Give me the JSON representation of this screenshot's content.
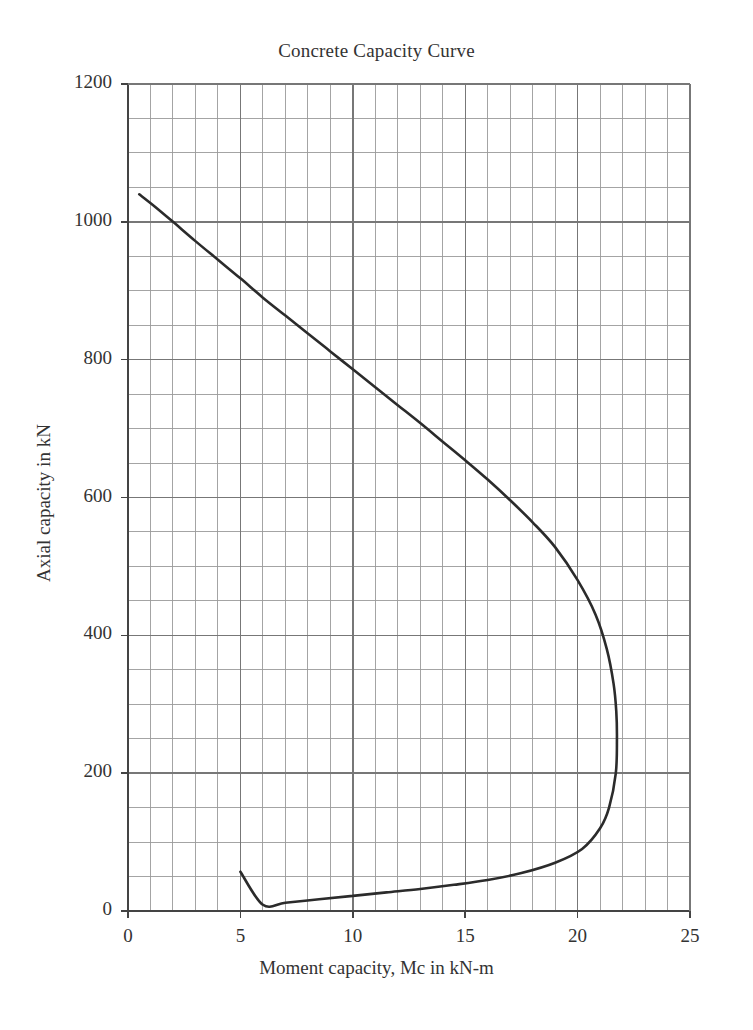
{
  "chart_data": {
    "type": "line",
    "title": "Concrete Capacity Curve",
    "xlabel": "Moment capacity, Mc in kN-m",
    "ylabel": "Axial capacity in kN",
    "xlim": [
      0,
      25
    ],
    "ylim": [
      0,
      1200
    ],
    "x_major_ticks": [
      0,
      5,
      10,
      15,
      20,
      25
    ],
    "y_major_ticks": [
      0,
      200,
      400,
      600,
      800,
      1000,
      1200
    ],
    "x_minor_step": 1,
    "y_minor_step": 50,
    "x_tick_labels": [
      "0",
      "5",
      "10",
      "15",
      "20",
      "25"
    ],
    "y_tick_labels": [
      "0",
      "200",
      "400",
      "600",
      "800",
      "1000",
      "1200"
    ],
    "grid": true,
    "legend": false,
    "legend_position": "none",
    "line_color": "#2b2b2b",
    "grid_color": "#777777",
    "axis_color": "#444444",
    "background_color": "#ffffff",
    "annotations": [],
    "series": [
      {
        "name": "Concrete capacity interaction curve",
        "comment": "P-M interaction diagram: x = moment capacity Mc (kN-m), y = axial capacity (kN)",
        "points": [
          [
            0.5,
            1040
          ],
          [
            1.2,
            1022
          ],
          [
            2.0,
            1000
          ],
          [
            3.0,
            972
          ],
          [
            4.0,
            945
          ],
          [
            5.0,
            918
          ],
          [
            6.0,
            890
          ],
          [
            7.0,
            864
          ],
          [
            8.0,
            838
          ],
          [
            9.0,
            812
          ],
          [
            10.0,
            786
          ],
          [
            11.0,
            760
          ],
          [
            12.0,
            734
          ],
          [
            13.0,
            708
          ],
          [
            14.0,
            681
          ],
          [
            15.0,
            654
          ],
          [
            16.0,
            626
          ],
          [
            17.0,
            596
          ],
          [
            18.0,
            564
          ],
          [
            19.0,
            528
          ],
          [
            20.0,
            480
          ],
          [
            20.8,
            430
          ],
          [
            21.3,
            380
          ],
          [
            21.6,
            330
          ],
          [
            21.72,
            290
          ],
          [
            21.75,
            250
          ],
          [
            21.7,
            200
          ],
          [
            21.4,
            150
          ],
          [
            21.0,
            120
          ],
          [
            20.2,
            90
          ],
          [
            19.0,
            70
          ],
          [
            17.5,
            55
          ],
          [
            16.0,
            45
          ],
          [
            14.5,
            38
          ],
          [
            13.0,
            32
          ],
          [
            11.5,
            27
          ],
          [
            10.0,
            22
          ],
          [
            8.5,
            17
          ],
          [
            7.0,
            12
          ],
          [
            6.0,
            9
          ],
          [
            5.0,
            57
          ]
        ],
        "key_points": {
          "pure_axial_top": [
            0.5,
            1040
          ],
          "balanced_point_max_moment": [
            21.75,
            515
          ],
          "lower_end": [
            5.0,
            57
          ]
        }
      }
    ]
  }
}
